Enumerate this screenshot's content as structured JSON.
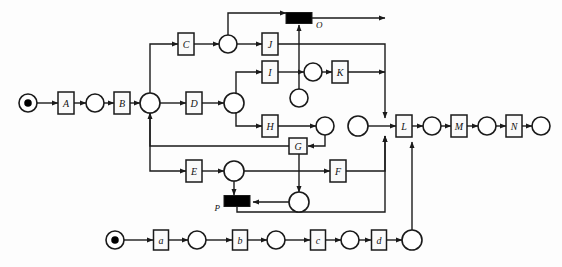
{
  "diagram": {
    "type": "petri-net",
    "width": 562,
    "height": 267,
    "colors": {
      "stroke": "#1a1a1a",
      "fill_place": "#ffffff",
      "fill_transition": "#fafafa",
      "fill_bar": "#000000",
      "background": "#fdfdfd"
    },
    "transitions": [
      {
        "id": "A",
        "label": "A",
        "x": 66,
        "y": 103,
        "w": 16,
        "h": 22,
        "kind": "box"
      },
      {
        "id": "B",
        "label": "B",
        "x": 122,
        "y": 103,
        "w": 16,
        "h": 22,
        "kind": "box"
      },
      {
        "id": "C",
        "label": "C",
        "x": 186,
        "y": 44,
        "w": 16,
        "h": 22,
        "kind": "box"
      },
      {
        "id": "D",
        "label": "D",
        "x": 194,
        "y": 103,
        "w": 16,
        "h": 22,
        "kind": "box"
      },
      {
        "id": "E",
        "label": "E",
        "x": 194,
        "y": 171,
        "w": 16,
        "h": 22,
        "kind": "box"
      },
      {
        "id": "F",
        "label": "F",
        "x": 338,
        "y": 171,
        "w": 16,
        "h": 22,
        "kind": "box"
      },
      {
        "id": "G",
        "label": "G",
        "x": 298,
        "y": 146,
        "w": 18,
        "h": 16,
        "kind": "box"
      },
      {
        "id": "H",
        "label": "H",
        "x": 270,
        "y": 126,
        "w": 16,
        "h": 22,
        "kind": "box"
      },
      {
        "id": "I",
        "label": "I",
        "x": 270,
        "y": 72,
        "w": 16,
        "h": 22,
        "kind": "box"
      },
      {
        "id": "J",
        "label": "J",
        "x": 270,
        "y": 44,
        "w": 16,
        "h": 22,
        "kind": "box"
      },
      {
        "id": "K",
        "label": "K",
        "x": 340,
        "y": 72,
        "w": 16,
        "h": 22,
        "kind": "box"
      },
      {
        "id": "L",
        "label": "L",
        "x": 404,
        "y": 126,
        "w": 16,
        "h": 22,
        "kind": "box"
      },
      {
        "id": "M",
        "label": "M",
        "x": 459,
        "y": 126,
        "w": 16,
        "h": 22,
        "kind": "box"
      },
      {
        "id": "N",
        "label": "N",
        "x": 514,
        "y": 126,
        "w": 16,
        "h": 22,
        "kind": "box"
      },
      {
        "id": "O",
        "label": "O",
        "x": 299,
        "y": 18,
        "w": 26,
        "h": 11,
        "kind": "bar",
        "label_pos": "right"
      },
      {
        "id": "P",
        "label": "P",
        "x": 237,
        "y": 201,
        "w": 26,
        "h": 11,
        "kind": "bar",
        "label_pos": "left"
      },
      {
        "id": "a",
        "label": "a",
        "x": 161,
        "y": 240,
        "w": 15,
        "h": 20,
        "kind": "box"
      },
      {
        "id": "b",
        "label": "b",
        "x": 240,
        "y": 240,
        "w": 15,
        "h": 20,
        "kind": "box"
      },
      {
        "id": "c",
        "label": "c",
        "x": 318,
        "y": 240,
        "w": 15,
        "h": 20,
        "kind": "box"
      },
      {
        "id": "d",
        "label": "d",
        "x": 379,
        "y": 240,
        "w": 15,
        "h": 20,
        "kind": "box"
      }
    ],
    "places": [
      {
        "id": "p_start_top",
        "x": 28,
        "y": 103,
        "r": 9,
        "tokens": 1
      },
      {
        "id": "p_A_B",
        "x": 95,
        "y": 103,
        "r": 9,
        "tokens": 0
      },
      {
        "id": "p_join_B",
        "x": 150,
        "y": 103,
        "r": 10,
        "tokens": 0
      },
      {
        "id": "p_C_J",
        "x": 228,
        "y": 44,
        "r": 9,
        "tokens": 0
      },
      {
        "id": "p_D_fork",
        "x": 234,
        "y": 103,
        "r": 10,
        "tokens": 0
      },
      {
        "id": "p_I_K",
        "x": 313,
        "y": 72,
        "r": 9,
        "tokens": 0
      },
      {
        "id": "p_mid_O",
        "x": 299,
        "y": 98,
        "r": 9,
        "tokens": 0
      },
      {
        "id": "p_H_out",
        "x": 325,
        "y": 126,
        "r": 9,
        "tokens": 0
      },
      {
        "id": "p_merge_L",
        "x": 358,
        "y": 126,
        "r": 10,
        "tokens": 0
      },
      {
        "id": "p_L_M",
        "x": 432,
        "y": 126,
        "r": 9,
        "tokens": 0
      },
      {
        "id": "p_M_N",
        "x": 487,
        "y": 126,
        "r": 9,
        "tokens": 0
      },
      {
        "id": "p_N_end",
        "x": 541,
        "y": 126,
        "r": 9,
        "tokens": 0
      },
      {
        "id": "p_E_out",
        "x": 234,
        "y": 171,
        "r": 10,
        "tokens": 0
      },
      {
        "id": "p_G_out",
        "x": 299,
        "y": 202,
        "r": 10,
        "tokens": 0
      },
      {
        "id": "p_start_bot",
        "x": 115,
        "y": 240,
        "r": 9,
        "tokens": 1
      },
      {
        "id": "p_a_b",
        "x": 197,
        "y": 240,
        "r": 9,
        "tokens": 0
      },
      {
        "id": "p_b_c",
        "x": 276,
        "y": 240,
        "r": 9,
        "tokens": 0
      },
      {
        "id": "p_c_d",
        "x": 350,
        "y": 240,
        "r": 9,
        "tokens": 0
      },
      {
        "id": "p_d_out",
        "x": 412,
        "y": 240,
        "r": 10,
        "tokens": 0
      }
    ],
    "arcs": [
      {
        "id": "arc-start-A",
        "from": "p_start_top",
        "to": "A",
        "path": "M37,103 L58,103"
      },
      {
        "id": "arc-A-p1",
        "from": "A",
        "to": "p_A_B",
        "path": "M74,103 L86,103"
      },
      {
        "id": "arc-p1-B",
        "from": "p_A_B",
        "to": "B",
        "path": "M104,103 L114,103"
      },
      {
        "id": "arc-B-join",
        "from": "B",
        "to": "p_join_B",
        "path": "M130,103 L140,103"
      },
      {
        "id": "arc-join-up-C",
        "from": "p_join_B",
        "to": "C",
        "path": "M150,93 L150,44 L178,44"
      },
      {
        "id": "arc-join-D",
        "from": "p_join_B",
        "to": "D",
        "path": "M160,103 L186,103"
      },
      {
        "id": "arc-C-p",
        "from": "C",
        "to": "p_C_J",
        "path": "M194,44 L219,44"
      },
      {
        "id": "arc-p-J",
        "from": "p_C_J",
        "to": "J",
        "path": "M237,44 L262,44"
      },
      {
        "id": "arc-p-up-O",
        "from": "p_C_J",
        "to": "O",
        "path": "M228,35 L228,13 L286,13"
      },
      {
        "id": "arc-D-p",
        "from": "D",
        "to": "p_D_fork",
        "path": "M202,103 L224,103"
      },
      {
        "id": "arc-fork-I",
        "from": "p_D_fork",
        "to": "I",
        "path": "M236,95 L236,72 L262,72"
      },
      {
        "id": "arc-fork-H",
        "from": "p_D_fork",
        "to": "H",
        "path": "M236,112 L236,126 L262,126"
      },
      {
        "id": "arc-I-p",
        "from": "I",
        "to": "p_I_K",
        "path": "M278,72 L304,72"
      },
      {
        "id": "arc-p-K",
        "from": "p_I_K",
        "to": "K",
        "path": "M322,72 L332,72"
      },
      {
        "id": "arc-H-p",
        "from": "H",
        "to": "p_H_out",
        "path": "M278,126 L316,126"
      },
      {
        "id": "arc-pH-G",
        "from": "p_H_out",
        "to": "G",
        "path": "M325,135 L325,146 L308,146"
      },
      {
        "id": "arc-G-down",
        "from": "G",
        "to": "p_G_out",
        "path": "M299,154 L299,192"
      },
      {
        "id": "arc-pmid-O",
        "from": "p_mid_O",
        "to": "O",
        "path": "M299,89 L299,25"
      },
      {
        "id": "arc-J-right",
        "from": "J",
        "to": "p_merge_L",
        "path": "M278,44 L385,44 L385,118"
      },
      {
        "id": "arc-K-right",
        "from": "K",
        "to": "p_merge_L",
        "path": "M348,72 L385,72"
      },
      {
        "id": "arc-O-right",
        "from": "O",
        "to": "p_merge_L",
        "path": "M312,18 L385,18"
      },
      {
        "id": "arc-merge-L",
        "from": "p_merge_L",
        "to": "L",
        "path": "M368,126 L396,126"
      },
      {
        "id": "arc-L-p",
        "from": "L",
        "to": "p_L_M",
        "path": "M412,126 L423,126"
      },
      {
        "id": "arc-p-M",
        "from": "p_L_M",
        "to": "M",
        "path": "M441,126 L451,126"
      },
      {
        "id": "arc-M-p",
        "from": "M",
        "to": "p_M_N",
        "path": "M467,126 L478,126"
      },
      {
        "id": "arc-p-N",
        "from": "p_M_N",
        "to": "N",
        "path": "M496,126 L506,126"
      },
      {
        "id": "arc-N-p",
        "from": "N",
        "to": "p_N_end",
        "path": "M522,126 L532,126"
      },
      {
        "id": "arc-G-back",
        "from": "G",
        "to": "p_join_B",
        "path": "M290,146 L150,146 L150,113"
      },
      {
        "id": "arc-joinE",
        "from": "p_join_B",
        "to": "E",
        "path": "M150,113 L150,171 L186,171"
      },
      {
        "id": "arc-E-p",
        "from": "E",
        "to": "p_E_out",
        "path": "M202,171 L224,171"
      },
      {
        "id": "arc-pE-P",
        "from": "p_E_out",
        "to": "P",
        "path": "M234,181 L234,195"
      },
      {
        "id": "arc-pE-F",
        "from": "p_E_out",
        "to": "F",
        "path": "M244,171 L330,171"
      },
      {
        "id": "arc-pG-P",
        "from": "p_G_out",
        "to": "P",
        "path": "M289,202 L253,202"
      },
      {
        "id": "arc-F-merge",
        "from": "F",
        "to": "p_merge_L",
        "path": "M346,171 L385,171 L385,136"
      },
      {
        "id": "arc-P-merge",
        "from": "P",
        "to": "p_merge_L",
        "path": "M237,207 L237,212 L385,212 L385,136"
      },
      {
        "id": "arc-start-a",
        "from": "p_start_bot",
        "to": "a",
        "path": "M124,240 L153,240"
      },
      {
        "id": "arc-a-p",
        "from": "a",
        "to": "p_a_b",
        "path": "M169,240 L188,240"
      },
      {
        "id": "arc-p-b",
        "from": "p_a_b",
        "to": "b",
        "path": "M206,240 L232,240"
      },
      {
        "id": "arc-b-p",
        "from": "b",
        "to": "p_b_c",
        "path": "M248,240 L267,240"
      },
      {
        "id": "arc-p-c",
        "from": "p_b_c",
        "to": "c",
        "path": "M285,240 L310,240"
      },
      {
        "id": "arc-c-p",
        "from": "c",
        "to": "p_c_d",
        "path": "M326,240 L341,240"
      },
      {
        "id": "arc-p-d",
        "from": "p_c_d",
        "to": "d",
        "path": "M359,240 L371,240"
      },
      {
        "id": "arc-d-p",
        "from": "d",
        "to": "p_d_out",
        "path": "M387,240 L402,240"
      },
      {
        "id": "arc-pd-L",
        "from": "p_d_out",
        "to": "L",
        "path": "M412,230 L412,142"
      }
    ]
  }
}
